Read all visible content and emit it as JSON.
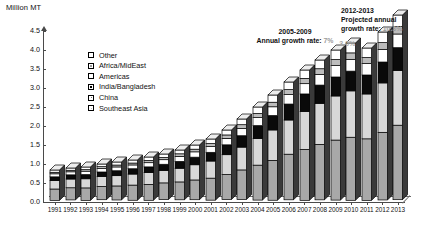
{
  "chart_data": {
    "type": "bar",
    "stacked": true,
    "title": "",
    "ylabel": "Million MT",
    "xlabel": "",
    "ylim": [
      0.0,
      4.5
    ],
    "ytick_step": 0.5,
    "grid": false,
    "legend_position": "upper-left-inside",
    "yticks": [
      "0.0",
      "0.5",
      "1.0",
      "1.5",
      "2.0",
      "2.5",
      "3.0",
      "3.5",
      "4.0",
      "4.5"
    ],
    "categories": [
      "1991",
      "1992",
      "1993",
      "1994",
      "1995",
      "1996",
      "1997",
      "1998",
      "1999",
      "2000",
      "2001",
      "2002",
      "2003",
      "2004",
      "2005",
      "2006",
      "2007",
      "2008",
      "2009",
      "2010",
      "2011",
      "2012",
      "2013"
    ],
    "series": [
      {
        "name": "Southeast Asia",
        "values": [
          0.3,
          0.32,
          0.33,
          0.35,
          0.37,
          0.4,
          0.42,
          0.44,
          0.47,
          0.52,
          0.58,
          0.66,
          0.78,
          0.92,
          1.05,
          1.2,
          1.34,
          1.46,
          1.58,
          1.66,
          1.62,
          1.78,
          1.96
        ]
      },
      {
        "name": "China",
        "values": [
          0.22,
          0.23,
          0.24,
          0.26,
          0.27,
          0.29,
          0.31,
          0.33,
          0.36,
          0.4,
          0.45,
          0.52,
          0.6,
          0.7,
          0.8,
          0.9,
          1.0,
          1.08,
          1.16,
          1.22,
          1.18,
          1.3,
          1.44
        ]
      },
      {
        "name": "India/Bangladesh",
        "values": [
          0.1,
          0.11,
          0.11,
          0.12,
          0.13,
          0.14,
          0.15,
          0.16,
          0.18,
          0.2,
          0.23,
          0.26,
          0.3,
          0.34,
          0.38,
          0.42,
          0.46,
          0.48,
          0.5,
          0.52,
          0.5,
          0.55,
          0.6
        ]
      },
      {
        "name": "Americas",
        "values": [
          0.08,
          0.08,
          0.09,
          0.09,
          0.1,
          0.1,
          0.11,
          0.12,
          0.13,
          0.14,
          0.15,
          0.17,
          0.19,
          0.21,
          0.23,
          0.25,
          0.27,
          0.28,
          0.3,
          0.31,
          0.3,
          0.33,
          0.36
        ]
      },
      {
        "name": "Africa/MidEast",
        "values": [
          0.04,
          0.04,
          0.04,
          0.05,
          0.05,
          0.05,
          0.06,
          0.06,
          0.07,
          0.07,
          0.08,
          0.09,
          0.1,
          0.11,
          0.12,
          0.13,
          0.14,
          0.15,
          0.16,
          0.17,
          0.16,
          0.18,
          0.2
        ]
      },
      {
        "name": "Other",
        "values": [
          0.06,
          0.06,
          0.07,
          0.07,
          0.08,
          0.08,
          0.09,
          0.09,
          0.1,
          0.11,
          0.12,
          0.13,
          0.15,
          0.17,
          0.19,
          0.2,
          0.22,
          0.23,
          0.25,
          0.26,
          0.25,
          0.28,
          0.3
        ]
      }
    ],
    "totals": [
      0.8,
      0.84,
      0.88,
      0.94,
      1.0,
      1.06,
      1.14,
      1.2,
      1.31,
      1.44,
      1.61,
      1.83,
      2.12,
      2.45,
      2.77,
      3.1,
      3.43,
      3.68,
      3.95,
      4.14,
      4.01,
      4.42,
      4.86
    ],
    "annotations": [
      {
        "id": "mid-growth",
        "line1": "2005-2009",
        "line2_prefix": "Annual growth rate: ",
        "line2_value": "7%"
      },
      {
        "id": "right-growth",
        "line1": "2012-2013",
        "line2": "Projected annual",
        "line3_prefix": "growth rate: ",
        "line3_value": "10.3%"
      },
      {
        "id": "drop-2011",
        "value": "-3.0%"
      }
    ]
  },
  "axis": {
    "y_title": "Million MT"
  },
  "legend": {
    "items": [
      {
        "label": "Other",
        "swatch": "other"
      },
      {
        "label": "Africa/MidEast",
        "swatch": "afr"
      },
      {
        "label": "Americas",
        "swatch": "amer"
      },
      {
        "label": "India/Bangladesh",
        "swatch": "india"
      },
      {
        "label": "China",
        "swatch": "china"
      },
      {
        "label": "Southeast Asia",
        "swatch": "sea"
      }
    ]
  },
  "annotations": {
    "mid_line1": "2005-2009",
    "mid_line2_prefix": "Annual growth rate: ",
    "mid_rate": "7%",
    "right_line1": "2012-2013",
    "right_line2": "Projected annual",
    "right_line3_prefix": "growth rate: ",
    "right_rate": "10.3%",
    "drop_label": "-3.0%"
  },
  "colors": {
    "southeast_asia": "#a8a8a8",
    "china": "#d8d8d8",
    "india_bangladesh": "#0a0a0a",
    "americas": "#ffffff",
    "africa_mideast": "#bcbcbc",
    "other": "#ffffff",
    "axis": "#4a4a4a",
    "gray_rate_text": "#9b9b9b"
  }
}
